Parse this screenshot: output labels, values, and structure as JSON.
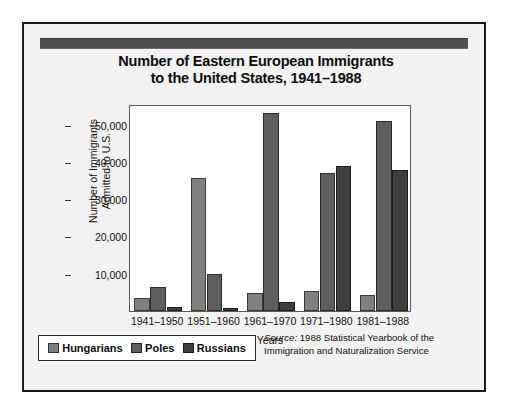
{
  "title": {
    "line1": "Number of Eastern European Immigrants",
    "line2": "to the United States, 1941–1988"
  },
  "ylabel": {
    "line1": "Number of Immigrants",
    "line2": "Admitted to U.S."
  },
  "xlabel": "Years",
  "legend": {
    "items": [
      {
        "label": "Hungarians",
        "color": "#808080"
      },
      {
        "label": "Poles",
        "color": "#5e5e5e"
      },
      {
        "label": "Russians",
        "color": "#3f3f3f"
      }
    ]
  },
  "source": {
    "prefix": "Source:",
    "line1": " 1988 Statistical Yearbook of the",
    "line2": "Immigration and Naturalization Service"
  },
  "colors": {
    "accent_bar": "#4f4f4f",
    "card_background": "#f2f2f2",
    "plot_background": "#ffffff",
    "frame": "#1a1a1a",
    "hungarians": "#808080",
    "poles": "#5e5e5e",
    "russians": "#3f3f3f"
  },
  "chart_data": {
    "type": "bar",
    "title": "Number of Eastern European Immigrants to the United States, 1941–1988",
    "xlabel": "Years",
    "ylabel": "Number of Immigrants Admitted to U.S.",
    "categories": [
      "1941–1950",
      "1951–1960",
      "1961–1970",
      "1971–1980",
      "1981–1988"
    ],
    "series": [
      {
        "name": "Hungarians",
        "color": "#808080",
        "values": [
          3500,
          35600,
          4900,
          5400,
          4300
        ]
      },
      {
        "name": "Poles",
        "color": "#5e5e5e",
        "values": [
          6400,
          9900,
          53000,
          36900,
          51000
        ]
      },
      {
        "name": "Russians",
        "color": "#3f3f3f",
        "values": [
          1000,
          900,
          2400,
          38800,
          37700
        ]
      }
    ],
    "ylim": [
      0,
      55500
    ],
    "yticks": [
      10000,
      20000,
      30000,
      40000,
      50000
    ],
    "ytick_labels": [
      "10,000",
      "20,000",
      "30,000",
      "40,000",
      "50,000"
    ],
    "grid": false,
    "legend_position": "below-left",
    "annotations": [
      "Source: 1988 Statistical Yearbook of the Immigration and Naturalization Service"
    ]
  }
}
